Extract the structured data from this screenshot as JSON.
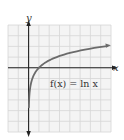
{
  "chart_data": {
    "type": "line",
    "title": "",
    "xlabel": "x",
    "ylabel": "y",
    "annotation": "f(x) = ln x",
    "series": [
      {
        "name": "f(x) = ln x",
        "x": [
          0.05,
          0.1,
          0.2,
          0.3,
          0.5,
          0.75,
          1,
          1.5,
          2,
          3,
          4,
          5,
          6,
          7,
          7.6
        ],
        "values": [
          -3.0,
          -2.303,
          -1.609,
          -1.204,
          -0.693,
          -0.288,
          0,
          0.405,
          0.693,
          1.099,
          1.386,
          1.609,
          1.792,
          1.946,
          2.028
        ]
      }
    ],
    "xlim": [
      -2,
      8
    ],
    "ylim": [
      -6,
      4
    ],
    "grid": true,
    "color": "#666666"
  },
  "labels": {
    "y_axis": "y",
    "x_axis": "x",
    "function": "f(x) = ln x"
  },
  "colors": {
    "grid": "#d6d6d6",
    "axis": "#222222",
    "curve": "#6b6b6b",
    "grid_bg": "#f4f4f4"
  }
}
